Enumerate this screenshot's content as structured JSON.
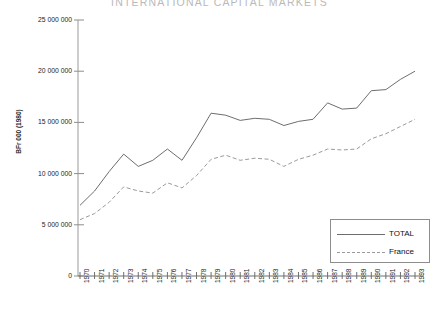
{
  "chart_data": {
    "type": "line",
    "title": "INTERNATIONAL CAPITAL MARKETS",
    "xlabel": "",
    "ylabel": "BFr 000 (1980)",
    "ylim": [
      0,
      25000000
    ],
    "ytick_values": [
      0,
      5000000,
      10000000,
      15000000,
      20000000,
      25000000
    ],
    "ytick_labels": [
      "0",
      "5 000 000",
      "10 000 000",
      "15 000 000",
      "20 000 000",
      "25 000 000"
    ],
    "grid": false,
    "legend_position": "bottom-right",
    "categories": [
      "1970",
      "1971",
      "1972",
      "1973",
      "1974",
      "1975",
      "1976",
      "1977",
      "1978",
      "1979",
      "1980",
      "1981",
      "1982",
      "1983",
      "1984",
      "1985",
      "1986",
      "1987",
      "1988",
      "1989",
      "1990",
      "1991",
      "1992",
      "1993"
    ],
    "series": [
      {
        "name": "TOTAL",
        "style": "solid",
        "color": "#6e6e6e",
        "values": [
          6900000,
          8300000,
          10200000,
          11900000,
          10700000,
          11300000,
          12400000,
          11300000,
          13500000,
          15900000,
          15700000,
          15200000,
          15400000,
          15300000,
          14700000,
          15100000,
          15300000,
          16900000,
          16300000,
          16400000,
          18100000,
          18200000,
          19200000,
          20000000
        ]
      },
      {
        "name": "France",
        "style": "dashed",
        "color": "#9a9a9a",
        "values": [
          5500000,
          6100000,
          7200000,
          8700000,
          8300000,
          8100000,
          9100000,
          8600000,
          9800000,
          11400000,
          11800000,
          11300000,
          11500000,
          11400000,
          10700000,
          11400000,
          11800000,
          12400000,
          12300000,
          12400000,
          13400000,
          13900000,
          14600000,
          15300000
        ]
      }
    ]
  },
  "legend": {
    "items": [
      {
        "label": "TOTAL"
      },
      {
        "label": "France"
      }
    ]
  }
}
